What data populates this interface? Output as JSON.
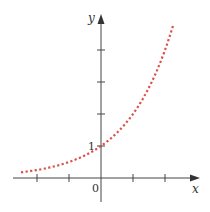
{
  "chart_data": {
    "type": "line",
    "title": "",
    "xlabel": "x",
    "ylabel": "y",
    "function": "y = 2^x",
    "x": [
      -2.5,
      -2,
      -1.5,
      -1,
      -0.5,
      0,
      0.5,
      1,
      1.5,
      2,
      2.25
    ],
    "series": [
      {
        "name": "exponential curve",
        "style": "dotted",
        "color": "#d9534a",
        "values": [
          0.18,
          0.25,
          0.35,
          0.5,
          0.71,
          1,
          1.41,
          2,
          2.83,
          4,
          4.76
        ]
      }
    ],
    "xlim": [
      -3,
      3.2
    ],
    "ylim": [
      -1,
      5
    ],
    "x_ticks": [
      -2,
      -1,
      1,
      2
    ],
    "y_ticks": [
      1,
      2,
      3,
      4
    ],
    "annotations": [
      {
        "text": "0",
        "at": "origin"
      },
      {
        "text": "1",
        "at": "y-intercept"
      }
    ],
    "grid": false,
    "legend": "none"
  },
  "labels": {
    "x_axis": "x",
    "y_axis": "y",
    "origin": "0",
    "y_intercept": "1"
  },
  "colors": {
    "axis": "#444444",
    "curve": "#d9534a"
  }
}
